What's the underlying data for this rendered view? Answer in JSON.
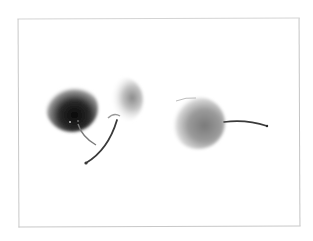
{
  "image": {
    "subject": "cherries",
    "description": "Grayscale-toned photo of three cherries on white background inside a thin frame",
    "objects": [
      {
        "name": "dark-cherry",
        "tone": "dark"
      },
      {
        "name": "light-cherry-halo",
        "tone": "light"
      },
      {
        "name": "right-cherry",
        "tone": "medium"
      }
    ],
    "colors": {
      "background": "#ffffff",
      "frame": "#c8c8c8",
      "dark_cherry": "#1a1a1a",
      "medium_cherry": "#8a8a8a",
      "stem": "#3a3a3a"
    }
  }
}
